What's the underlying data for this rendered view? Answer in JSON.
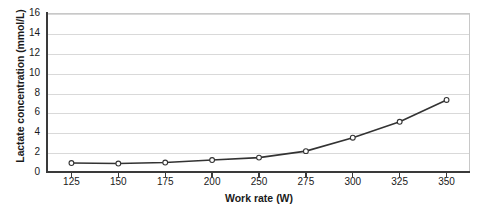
{
  "chart_data": {
    "type": "line",
    "title": "",
    "subtitle": "",
    "xlabel": "Work rate (W)",
    "ylabel": "Lactate concentration (mmol/L)",
    "categories": [
      "125",
      "150",
      "175",
      "200",
      "250",
      "275",
      "300",
      "325",
      "350"
    ],
    "xtick_labels": [
      "125",
      "150",
      "175",
      "200",
      "250",
      "275",
      "300",
      "325",
      "350"
    ],
    "ytick_labels": [
      "0",
      "2",
      "4",
      "6",
      "8",
      "10",
      "12",
      "14",
      "16"
    ],
    "ytick_values": [
      0,
      2,
      4,
      6,
      8,
      10,
      12,
      14,
      16
    ],
    "ylim": [
      0,
      16
    ],
    "grid": "horizontal",
    "legend": "none",
    "marker": "open-circle",
    "line_color": "#333333",
    "marker_edge_color": "#333333",
    "marker_face_color": "#ffffff",
    "grid_color": "#d9d9d9",
    "axis_color": "#3a3a3a",
    "background": "#ffffff",
    "series": [
      {
        "name": "Lactate concentration",
        "values": [
          0.9,
          0.85,
          0.95,
          1.2,
          1.45,
          2.1,
          3.45,
          5.05,
          7.25
        ]
      }
    ]
  },
  "axes": {
    "y_title": "Lactate concentration (mmol/L)",
    "x_title": "Work rate (W)"
  }
}
